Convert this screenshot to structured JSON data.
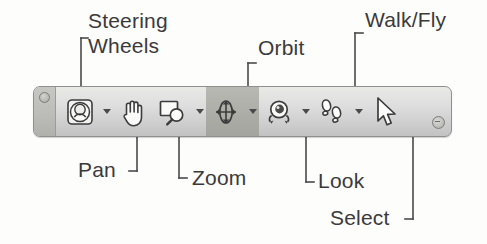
{
  "diagram": {
    "text_color": "#3a3a3a",
    "toolbar_border_color": "#8f8f8f",
    "toolbar_face_color": "#dedede",
    "highlight_color": "#adada8"
  },
  "annotations": [
    {
      "id": "steering-wheels",
      "label": "Steering\nWheels",
      "position": "top-left"
    },
    {
      "id": "orbit",
      "label": "Orbit",
      "position": "top-center"
    },
    {
      "id": "walk-fly",
      "label": "Walk/Fly",
      "position": "top-right"
    },
    {
      "id": "pan",
      "label": "Pan",
      "position": "bottom-left"
    },
    {
      "id": "zoom",
      "label": "Zoom",
      "position": "bottom-left-2"
    },
    {
      "id": "look",
      "label": "Look",
      "position": "bottom-center"
    },
    {
      "id": "select",
      "label": "Select",
      "position": "bottom-right"
    }
  ],
  "toolbar": {
    "grip": "toolbar-grip-handle",
    "end_button": "toolbar-options-button",
    "buttons": [
      {
        "id": "steering-wheels",
        "name": "steering-wheels-icon",
        "has_dropdown": true,
        "active": false
      },
      {
        "id": "pan",
        "name": "pan-hand-icon",
        "has_dropdown": false,
        "active": false
      },
      {
        "id": "zoom",
        "name": "zoom-magnifier-icon",
        "has_dropdown": true,
        "active": false
      },
      {
        "id": "orbit",
        "name": "orbit-icon",
        "has_dropdown": true,
        "active": true
      },
      {
        "id": "look",
        "name": "look-eye-icon",
        "has_dropdown": true,
        "active": false
      },
      {
        "id": "walk-fly",
        "name": "walk-fly-footprints-icon",
        "has_dropdown": true,
        "active": false
      },
      {
        "id": "select",
        "name": "select-cursor-icon",
        "has_dropdown": false,
        "active": false
      }
    ]
  }
}
